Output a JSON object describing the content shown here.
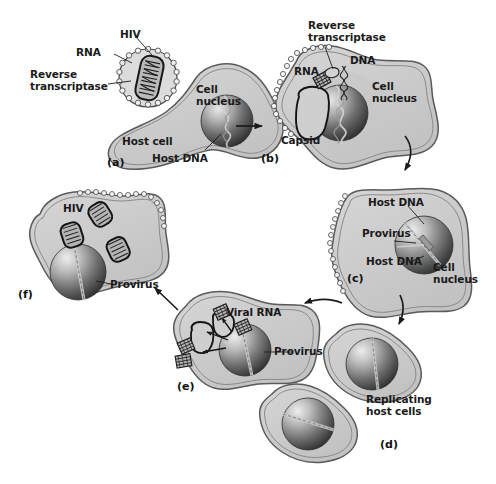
{
  "figure": {
    "background_color": "#ffffff",
    "cell_fill": "#cfcfcf",
    "cell_fill_inner": "#c4c4c4",
    "membrane_stroke": "#4a4a4a",
    "nucleus_dark": "#3a3a3a",
    "nucleus_light": "#d8d8d8",
    "label_color": "#1a1a1a",
    "arrow_color": "#1a1a1a"
  },
  "panels": [
    {
      "id": "a",
      "tag": "(a)",
      "labels": [
        {
          "key": "hiv",
          "text": "HIV"
        },
        {
          "key": "rna",
          "text": "RNA"
        },
        {
          "key": "reverse_transcriptase",
          "text": "Reverse\ntranscriptase"
        },
        {
          "key": "cell_nucleus",
          "text": "Cell\nnucleus"
        },
        {
          "key": "host_cell",
          "text": "Host cell"
        },
        {
          "key": "host_dna",
          "text": "Host DNA"
        }
      ]
    },
    {
      "id": "b",
      "tag": "(b)",
      "labels": [
        {
          "key": "reverse_transcriptase",
          "text": "Reverse\ntranscriptase"
        },
        {
          "key": "rna",
          "text": "RNA"
        },
        {
          "key": "dna",
          "text": "DNA"
        },
        {
          "key": "cell_nucleus",
          "text": "Cell\nnucleus"
        },
        {
          "key": "capsid",
          "text": "Capsid"
        }
      ]
    },
    {
      "id": "c",
      "tag": "(c)",
      "labels": [
        {
          "key": "host_dna_top",
          "text": "Host DNA"
        },
        {
          "key": "provirus",
          "text": "Provirus"
        },
        {
          "key": "host_dna_bottom",
          "text": "Host DNA"
        },
        {
          "key": "cell_nucleus",
          "text": "Cell\nnucleus"
        }
      ]
    },
    {
      "id": "d",
      "tag": "(d)",
      "labels": [
        {
          "key": "replicating_host_cells",
          "text": "Replicating\nhost cells"
        }
      ]
    },
    {
      "id": "e",
      "tag": "(e)",
      "labels": [
        {
          "key": "viral_rna",
          "text": "Viral RNA"
        },
        {
          "key": "provirus",
          "text": "Provirus"
        }
      ]
    },
    {
      "id": "f",
      "tag": "(f)",
      "labels": [
        {
          "key": "hiv",
          "text": "HIV"
        },
        {
          "key": "provirus",
          "text": "Provirus"
        }
      ]
    }
  ],
  "text": {
    "hiv": "HIV",
    "rna": "RNA",
    "dna": "DNA",
    "viral_rna": "Viral RNA",
    "reverse_transcriptase": "Reverse\ntranscriptase",
    "cell_nucleus": "Cell\nnucleus",
    "host_cell": "Host cell",
    "host_dna": "Host DNA",
    "capsid": "Capsid",
    "provirus": "Provirus",
    "replicating_host_cells": "Replicating\nhost cells",
    "tag_a": "(a)",
    "tag_b": "(b)",
    "tag_c": "(c)",
    "tag_d": "(d)",
    "tag_e": "(e)",
    "tag_f": "(f)"
  },
  "arrows": [
    {
      "key": "a_to_b",
      "from": "a",
      "to": "b",
      "style": "straight-right"
    },
    {
      "key": "b_to_c",
      "from": "b",
      "to": "c",
      "style": "curved-down-right"
    },
    {
      "key": "c_to_d",
      "from": "c",
      "to": "d",
      "style": "curved-down"
    },
    {
      "key": "d_to_e",
      "from": "d",
      "to": "e",
      "style": "curved-left"
    },
    {
      "key": "e_to_f",
      "from": "e",
      "to": "f",
      "style": "diagonal-up-left"
    }
  ]
}
